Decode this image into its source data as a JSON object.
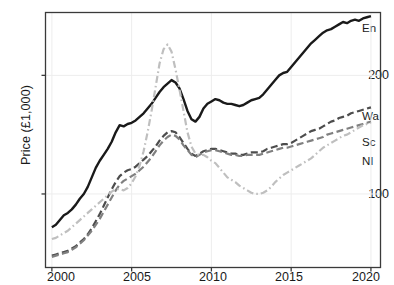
{
  "chart_data": {
    "type": "line",
    "title": "",
    "xlabel": "",
    "ylabel": "Price (£1,000)",
    "xlim": [
      1999.6,
      2020.6
    ],
    "ylim": [
      38,
      253
    ],
    "xticks": [
      2000,
      2005,
      2010,
      2015,
      2020
    ],
    "xtick_labels": [
      "2000",
      "2005",
      "2010",
      "2015",
      "2020"
    ],
    "yticks": [
      100,
      200
    ],
    "ytick_labels": [
      "100",
      "200"
    ],
    "grid": "vertical and horizontal faint gridlines at ticks",
    "legend_position": "right of lines, inline labels",
    "x": [
      2000.0,
      2000.25,
      2000.5,
      2000.75,
      2001.0,
      2001.25,
      2001.5,
      2001.75,
      2002.0,
      2002.25,
      2002.5,
      2002.75,
      2003.0,
      2003.25,
      2003.5,
      2003.75,
      2004.0,
      2004.25,
      2004.5,
      2004.75,
      2005.0,
      2005.25,
      2005.5,
      2005.75,
      2006.0,
      2006.25,
      2006.5,
      2006.75,
      2007.0,
      2007.25,
      2007.5,
      2007.75,
      2008.0,
      2008.25,
      2008.5,
      2008.75,
      2009.0,
      2009.25,
      2009.5,
      2009.75,
      2010.0,
      2010.25,
      2010.5,
      2010.75,
      2011.0,
      2011.25,
      2011.5,
      2011.75,
      2012.0,
      2012.25,
      2012.5,
      2012.75,
      2013.0,
      2013.25,
      2013.5,
      2013.75,
      2014.0,
      2014.25,
      2014.5,
      2014.75,
      2015.0,
      2015.25,
      2015.5,
      2015.75,
      2016.0,
      2016.25,
      2016.5,
      2016.75,
      2017.0,
      2017.25,
      2017.5,
      2017.75,
      2018.0,
      2018.25,
      2018.5,
      2018.75,
      2019.0,
      2019.25,
      2019.5,
      2019.75,
      2020.0
    ],
    "series": [
      {
        "name": "En",
        "label": "England",
        "color": "#1a1a1a",
        "linestyle": "solid",
        "values": [
          72,
          74,
          78,
          82,
          84,
          87,
          91,
          96,
          100,
          106,
          114,
          122,
          128,
          133,
          138,
          144,
          152,
          158,
          157,
          159,
          160,
          162,
          165,
          168,
          172,
          176,
          181,
          186,
          190,
          193,
          196,
          194,
          189,
          180,
          170,
          163,
          161,
          165,
          172,
          176,
          178,
          180,
          179,
          177,
          176,
          176,
          175,
          174,
          175,
          177,
          179,
          180,
          181,
          184,
          188,
          192,
          196,
          200,
          202,
          203,
          207,
          211,
          215,
          219,
          223,
          227,
          230,
          233,
          236,
          238,
          239,
          241,
          243,
          245,
          244,
          246,
          247,
          246,
          248,
          249,
          250
        ]
      },
      {
        "name": "Wa",
        "label": "Wales",
        "color": "#4d4d4d",
        "linestyle": "dashed",
        "values": [
          48,
          49,
          50,
          51,
          52,
          54,
          56,
          59,
          62,
          66,
          71,
          77,
          83,
          90,
          97,
          104,
          110,
          115,
          118,
          120,
          121,
          123,
          126,
          129,
          132,
          136,
          140,
          145,
          149,
          152,
          153,
          152,
          148,
          143,
          138,
          134,
          132,
          134,
          136,
          137,
          138,
          138,
          137,
          136,
          135,
          134,
          134,
          133,
          133,
          134,
          135,
          135,
          135,
          136,
          138,
          139,
          140,
          141,
          142,
          142,
          143,
          145,
          147,
          149,
          151,
          153,
          154,
          155,
          157,
          159,
          161,
          162,
          164,
          165,
          166,
          168,
          169,
          170,
          171,
          172,
          173
        ]
      },
      {
        "name": "Sc",
        "label": "Scotland",
        "color": "#808080",
        "linestyle": "dashed",
        "values": [
          47,
          48,
          49,
          50,
          51,
          53,
          55,
          58,
          61,
          65,
          69,
          74,
          79,
          85,
          91,
          97,
          103,
          108,
          111,
          113,
          115,
          117,
          120,
          123,
          127,
          131,
          136,
          141,
          145,
          148,
          150,
          149,
          146,
          141,
          137,
          133,
          131,
          133,
          135,
          136,
          137,
          137,
          136,
          135,
          134,
          133,
          133,
          132,
          132,
          133,
          133,
          133,
          133,
          134,
          135,
          136,
          137,
          138,
          139,
          139,
          140,
          141,
          142,
          143,
          144,
          145,
          146,
          147,
          148,
          150,
          151,
          152,
          153,
          154,
          155,
          156,
          157,
          158,
          159,
          160,
          161
        ]
      },
      {
        "name": "NI",
        "label": "Northern Ireland",
        "color": "#bfbfbf",
        "linestyle": "dashdot",
        "values": [
          62,
          63,
          65,
          67,
          69,
          72,
          75,
          78,
          81,
          84,
          87,
          90,
          93,
          96,
          99,
          102,
          104,
          104,
          103,
          105,
          109,
          115,
          124,
          136,
          152,
          170,
          190,
          210,
          222,
          226,
          220,
          205,
          188,
          170,
          152,
          140,
          134,
          133,
          133,
          131,
          128,
          126,
          122,
          118,
          114,
          112,
          110,
          107,
          105,
          103,
          101,
          100,
          100,
          101,
          103,
          106,
          110,
          113,
          116,
          118,
          120,
          122,
          124,
          126,
          128,
          130,
          133,
          136,
          139,
          141,
          143,
          145,
          147,
          149,
          150,
          152,
          154,
          156,
          158,
          159,
          160
        ]
      }
    ]
  },
  "axes": {
    "ylabel": "Price (£1,000)",
    "ytick_labels": [
      "200",
      "100"
    ],
    "xtick_labels": [
      "2000",
      "2005",
      "2010",
      "2015",
      "2020"
    ]
  },
  "legend": {
    "items": [
      {
        "name": "En"
      },
      {
        "name": "Wa"
      },
      {
        "name": "Sc"
      },
      {
        "name": "NI"
      }
    ]
  }
}
